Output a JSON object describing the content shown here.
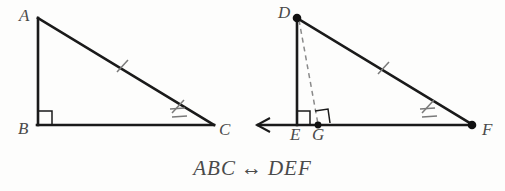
{
  "figure": {
    "caption_left": "ABC",
    "caption_relation": "↔",
    "caption_right": "DEF",
    "caption_full": "ABC ↔ DEF",
    "stroke_color": "#1a1a1a",
    "label_color": "#4a4a4a",
    "dash_color": "#8a8a8a",
    "tick_color": "#7a7a7a",
    "background_color": "#fdfdfc"
  },
  "triangle_left": {
    "name": "ABC",
    "vertices": [
      {
        "label": "A",
        "x": 38,
        "y": 18,
        "label_x": 19,
        "label_y": 7,
        "dot": false
      },
      {
        "label": "B",
        "x": 38,
        "y": 125,
        "label_x": 18,
        "label_y": 120,
        "dot": false
      },
      {
        "label": "C",
        "x": 213,
        "y": 125,
        "label_x": 219,
        "label_y": 121,
        "dot": false
      }
    ],
    "right_angle_at": "B",
    "tick_marks": [
      {
        "on": "AC",
        "count": 1,
        "x": 122,
        "y": 66
      },
      {
        "on": "AC",
        "count": 2,
        "x": 178,
        "y": 106
      }
    ]
  },
  "triangle_right": {
    "name": "DEF",
    "vertices": [
      {
        "label": "D",
        "x": 297,
        "y": 18,
        "label_x": 278,
        "label_y": 4,
        "dot": true
      },
      {
        "label": "E",
        "x": 297,
        "y": 125,
        "label_x": 290,
        "label_y": 126,
        "dot": false
      },
      {
        "label": "F",
        "x": 472,
        "y": 125,
        "label_x": 482,
        "label_y": 121,
        "dot": true
      },
      {
        "label": "G",
        "x": 318,
        "y": 125,
        "label_x": 312,
        "label_y": 126,
        "dot": true
      }
    ],
    "right_angle_at": "E",
    "right_angle_at_foot": "G",
    "altitude_segment": "DG",
    "altitude_style": "dashed",
    "ray_direction": "left",
    "ray_end_x": 256,
    "tick_marks": [
      {
        "on": "DF",
        "count": 1,
        "x": 383,
        "y": 68
      },
      {
        "on": "DF",
        "count": 2,
        "x": 428,
        "y": 106
      }
    ]
  }
}
